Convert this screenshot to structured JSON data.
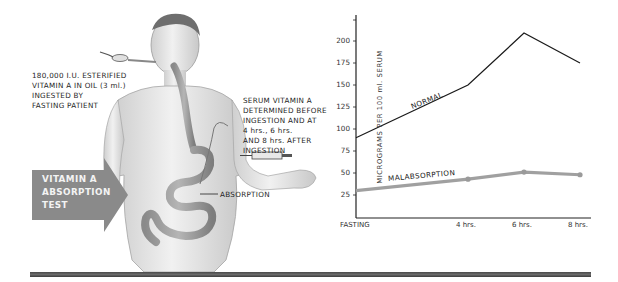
{
  "illustration": {
    "ingestion_caption": [
      "180,000 I.U. ESTERIFIED",
      "VITAMIN A IN OIL (3 ml.)",
      "INGESTED BY",
      "FASTING PATIENT"
    ],
    "serum_caption": [
      "SERUM VITAMIN A",
      "DETERMINED BEFORE",
      "INGESTION AND AT",
      "4 hrs., 6 hrs.",
      "AND 8 hrs. AFTER",
      "INGESTION"
    ],
    "absorption_label": "ABSORPTION",
    "test_arrow": [
      "VITAMIN A",
      "ABSORPTION",
      "TEST"
    ],
    "arrow_color": "#8a8a8a"
  },
  "chart_data": {
    "type": "line",
    "title": "",
    "xlabel": "",
    "ylabel": "MICROGRAMS PER 100 ml. SERUM",
    "categories": [
      "FASTING",
      "4 hrs.",
      "6 hrs.",
      "8 hrs."
    ],
    "x_positions_hours": [
      0,
      4,
      6,
      8
    ],
    "yticks": [
      25,
      50,
      75,
      100,
      125,
      150,
      175,
      200
    ],
    "ylim": [
      0,
      225
    ],
    "grid": false,
    "legend": "inline labels on lines",
    "series": [
      {
        "name": "NORMAL",
        "values": [
          90,
          150,
          209,
          175
        ],
        "color": "#1a1a1a"
      },
      {
        "name": "MALABSORPTION",
        "values": [
          30,
          43,
          51,
          48
        ],
        "color": "#a0a0a0"
      }
    ]
  }
}
